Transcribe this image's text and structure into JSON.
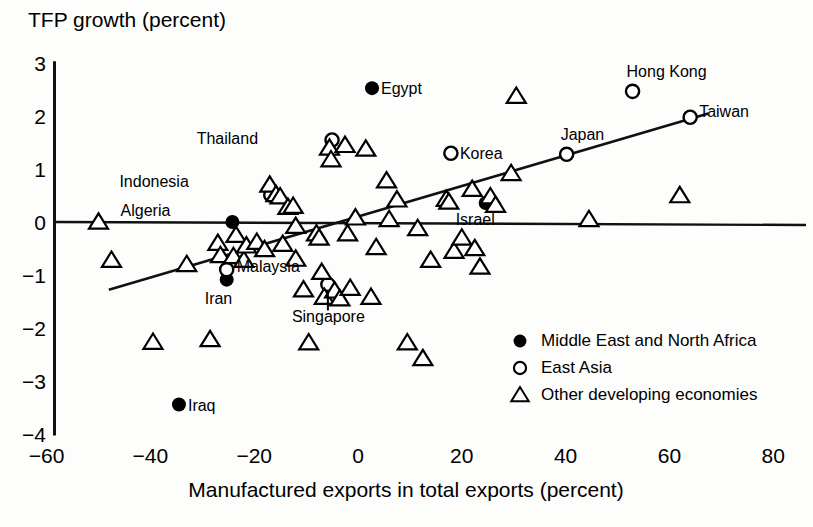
{
  "chart_data": {
    "type": "scatter",
    "title": "",
    "ylabel": "TFP growth (percent)",
    "xlabel": "Manufactured exports in total exports (percent)",
    "xlim": [
      -65,
      82
    ],
    "ylim": [
      -4,
      3
    ],
    "xticks": [
      -60,
      -40,
      -20,
      0,
      20,
      40,
      60,
      80
    ],
    "xticklabels": [
      "−60",
      "−40",
      "−20",
      "0",
      "20",
      "40",
      "60",
      "80"
    ],
    "yticks": [
      3,
      2,
      1,
      0,
      -1,
      -2,
      -3,
      -4
    ],
    "yticklabels": [
      "3",
      "2",
      "1",
      "0",
      "−1",
      "−2",
      "−3",
      "−4"
    ],
    "grid": false,
    "zero_line_y": 0,
    "trend_line": {
      "x0": -48,
      "y0": -1.28,
      "x1": 67.5,
      "y1": 2.05
    },
    "legend": {
      "position": "bottom-right",
      "entries": [
        {
          "marker": "filled-circle",
          "label": "Middle East and North Africa"
        },
        {
          "marker": "open-circle",
          "label": "East Asia"
        },
        {
          "marker": "open-triangle",
          "label": "Other developing economies"
        }
      ]
    },
    "series": [
      {
        "name": "Middle East and North Africa",
        "marker": "filled-circle",
        "points": [
          {
            "label": "Egypt",
            "x": 2.7,
            "y": 2.53,
            "label_dx": 9,
            "label_dy": 6
          },
          {
            "label": "Algeria",
            "x": -24.2,
            "y": 0.0,
            "label_dx": -62,
            "label_dy": -6
          },
          {
            "label": "Iran",
            "x": -25.3,
            "y": -1.09,
            "label_dx": -22,
            "label_dy": 24
          },
          {
            "label": "Israel",
            "x": 24.6,
            "y": 0.36,
            "label_dx": -30,
            "label_dy": 22
          },
          {
            "label": "Iraq",
            "x": -34.5,
            "y": -3.45,
            "label_dx": 9,
            "label_dy": 6
          }
        ]
      },
      {
        "name": "East Asia",
        "marker": "open-circle",
        "points": [
          {
            "label": "Thailand",
            "x": -5.0,
            "y": 1.55,
            "label_dx": -74,
            "label_dy": 4
          },
          {
            "label": "Indonesia",
            "x": -16.8,
            "y": 0.51,
            "label_dx": -82,
            "label_dy": -8
          },
          {
            "label": "Malaysia",
            "x": -25.3,
            "y": -0.9,
            "label_dx": 10,
            "label_dy": 2
          },
          {
            "label": "Singapore",
            "x": -5.8,
            "y": -1.18,
            "label_dx": -36,
            "label_dy": 38
          },
          {
            "label": "Korea",
            "x": 17.9,
            "y": 1.3,
            "label_dx": 9,
            "label_dy": 6
          },
          {
            "label": "Japan",
            "x": 40.2,
            "y": 1.28,
            "label_dx": -6,
            "label_dy": -14
          },
          {
            "label": "Hong Kong",
            "x": 52.9,
            "y": 2.47,
            "label_dx": -6,
            "label_dy": -14
          },
          {
            "label": "Taiwan",
            "x": 64.0,
            "y": 1.98,
            "label_dx": 9,
            "label_dy": 0
          }
        ]
      },
      {
        "name": "Other developing economies",
        "marker": "open-triangle",
        "points": [
          {
            "x": -50.0,
            "y": 0.0
          },
          {
            "x": -47.5,
            "y": -0.72
          },
          {
            "x": -39.5,
            "y": -2.27
          },
          {
            "x": -33.0,
            "y": -0.8
          },
          {
            "x": -28.5,
            "y": -2.22
          },
          {
            "x": -27.0,
            "y": -0.4
          },
          {
            "x": -26.5,
            "y": -0.63
          },
          {
            "x": -24.0,
            "y": -0.65
          },
          {
            "x": -23.5,
            "y": -0.25
          },
          {
            "x": -22.0,
            "y": -0.72
          },
          {
            "x": -21.5,
            "y": -0.45
          },
          {
            "x": -19.5,
            "y": -0.38
          },
          {
            "x": -18.0,
            "y": -0.52
          },
          {
            "x": -17.0,
            "y": 0.7
          },
          {
            "x": -15.8,
            "y": 0.52
          },
          {
            "x": -15.0,
            "y": 0.48
          },
          {
            "x": -14.5,
            "y": -0.42
          },
          {
            "x": -13.5,
            "y": 0.28
          },
          {
            "x": -12.5,
            "y": 0.3
          },
          {
            "x": -12.0,
            "y": -0.08
          },
          {
            "x": -12.0,
            "y": -0.7
          },
          {
            "x": -10.5,
            "y": -1.28
          },
          {
            "x": -9.5,
            "y": -2.28
          },
          {
            "x": -8.0,
            "y": -0.22
          },
          {
            "x": -7.5,
            "y": -0.3
          },
          {
            "x": -7.0,
            "y": -0.95
          },
          {
            "x": -6.5,
            "y": -1.42
          },
          {
            "x": -5.5,
            "y": 1.4
          },
          {
            "x": -5.2,
            "y": 1.18
          },
          {
            "x": -4.5,
            "y": -1.3
          },
          {
            "x": -3.5,
            "y": -1.45
          },
          {
            "x": -2.5,
            "y": 1.45
          },
          {
            "x": -2.0,
            "y": -0.22
          },
          {
            "x": -1.5,
            "y": -1.25
          },
          {
            "x": -0.5,
            "y": 0.08
          },
          {
            "x": 1.5,
            "y": 1.38
          },
          {
            "x": 2.5,
            "y": -1.42
          },
          {
            "x": 3.5,
            "y": -0.48
          },
          {
            "x": 5.5,
            "y": 0.78
          },
          {
            "x": 6.0,
            "y": 0.05
          },
          {
            "x": 7.5,
            "y": 0.42
          },
          {
            "x": 9.5,
            "y": -2.28
          },
          {
            "x": 11.5,
            "y": -0.12
          },
          {
            "x": 12.5,
            "y": -2.58
          },
          {
            "x": 14.0,
            "y": -0.72
          },
          {
            "x": 17.0,
            "y": 0.43
          },
          {
            "x": 17.5,
            "y": 0.38
          },
          {
            "x": 18.5,
            "y": -0.55
          },
          {
            "x": 20.0,
            "y": -0.3
          },
          {
            "x": 22.0,
            "y": 0.62
          },
          {
            "x": 22.5,
            "y": -0.5
          },
          {
            "x": 23.5,
            "y": -0.85
          },
          {
            "x": 25.5,
            "y": 0.48
          },
          {
            "x": 26.5,
            "y": 0.32
          },
          {
            "x": 29.5,
            "y": 0.92
          },
          {
            "x": 30.5,
            "y": 2.38
          },
          {
            "x": 44.5,
            "y": 0.05
          },
          {
            "x": 62.0,
            "y": 0.5
          }
        ]
      }
    ]
  }
}
